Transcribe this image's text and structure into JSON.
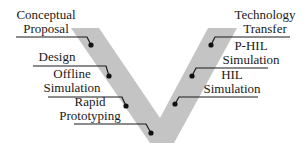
{
  "diagram": {
    "type": "V-model",
    "colors": {
      "band": "#c4c4c4",
      "line": "#1a1a1a",
      "dot": "#111111",
      "text": "#1a1a1a"
    },
    "left_stages": [
      {
        "line1": "Conceptual",
        "line2": "Proposal"
      },
      {
        "line1": "Design",
        "line2": ""
      },
      {
        "line1": "Offline",
        "line2": "Simulation"
      },
      {
        "line1": "Rapid",
        "line2": "Prototyping"
      }
    ],
    "right_stages": [
      {
        "line1": "Technology",
        "line2": "Transfer"
      },
      {
        "line1": "P-HIL",
        "line2": "Simulation"
      },
      {
        "line1": "HIL",
        "line2": "Simulation"
      }
    ]
  }
}
